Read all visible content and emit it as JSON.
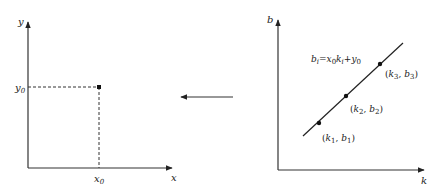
{
  "colors": {
    "ink": "#222222",
    "background": "#ffffff"
  },
  "left_panel": {
    "y_axis_label": "y",
    "x_axis_label": "x",
    "point_x_label": {
      "base": "x",
      "sub": "0"
    },
    "point_y_label": {
      "base": "y",
      "sub": "0"
    },
    "point": {
      "x": 99,
      "y": 87
    }
  },
  "transform_arrow": {
    "direction": "left"
  },
  "right_panel": {
    "y_axis_label": "b",
    "x_axis_label": "k",
    "equation": {
      "b": "b",
      "b_sub": "i",
      "eq": "=",
      "x": "x",
      "x_sub": "0",
      "k": "k",
      "k_sub": "i",
      "plus": "+",
      "y": "y",
      "y_sub": "0"
    },
    "points": [
      {
        "k": "k",
        "k_sub": "1",
        "b": "b",
        "b_sub": "1"
      },
      {
        "k": "k",
        "k_sub": "2",
        "b": "b",
        "b_sub": "2"
      },
      {
        "k": "k",
        "k_sub": "3",
        "b": "b",
        "b_sub": "3"
      }
    ]
  }
}
